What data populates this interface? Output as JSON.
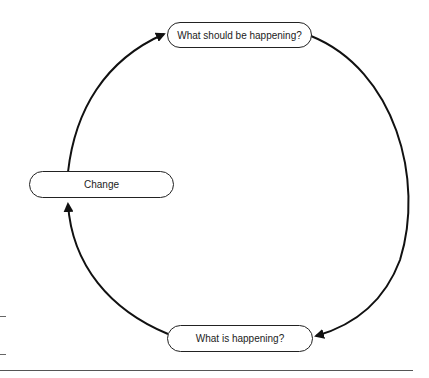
{
  "diagram": {
    "type": "cycle",
    "nodes": [
      {
        "id": "should",
        "label": "What should be happening?"
      },
      {
        "id": "is",
        "label": "What is happening?"
      },
      {
        "id": "change",
        "label": "Change"
      }
    ],
    "edges": [
      {
        "from": "should",
        "to": "is"
      },
      {
        "from": "is",
        "to": "change"
      },
      {
        "from": "change",
        "to": "should"
      }
    ],
    "colors": {
      "stroke": "#222222",
      "background": "#ffffff"
    }
  }
}
